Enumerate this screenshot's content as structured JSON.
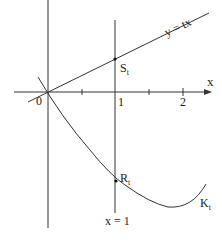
{
  "labels": {
    "line": "y = tx",
    "x_axis": "x",
    "origin": "0",
    "tick1": "1",
    "tick2": "2",
    "point_s": "S",
    "point_s_sub": "t",
    "point_r": "R",
    "point_r_sub": "t",
    "curve": "K",
    "curve_sub": "t",
    "vertical_line": "x = 1"
  },
  "colors": {
    "ink": "#222222",
    "background": "#ffffff"
  }
}
